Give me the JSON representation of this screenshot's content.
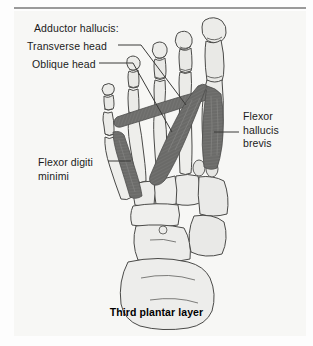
{
  "figure": {
    "caption": "Third plantar layer",
    "view": "plantar view of foot skeleton with third layer muscles"
  },
  "labels": {
    "adductor_group": "Adductor hallucis:",
    "transverse_head": "Transverse head",
    "oblique_head": "Oblique head",
    "flexor_digiti_minimi_line1": "Flexor digiti",
    "flexor_digiti_minimi_line2": "minimi",
    "flexor_hallucis_brevis_line1": "Flexor",
    "flexor_hallucis_brevis_line2": "hallucis",
    "flexor_hallucis_brevis_line3": "brevis"
  },
  "colors": {
    "muscle": "#6d6d6b",
    "muscle_dark": "#595957",
    "muscle_light": "#86867f",
    "bone_fill": "#e9e9e6",
    "bone_fill_light": "#f0f0ed",
    "bone_outline": "#4a4a48",
    "plate_background": "#f7f7f5",
    "page_background": "#fdfdfd",
    "rule": "#9a9a9a",
    "leader_line": "#3a3a38",
    "text": "#1b1b1b"
  }
}
